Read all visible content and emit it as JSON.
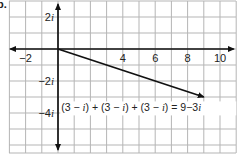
{
  "problem_label": "b.",
  "chart_data": {
    "type": "line",
    "title": "",
    "xlabel": "",
    "ylabel": "",
    "plane": "complex",
    "xlim": [
      -3,
      11
    ],
    "ylim": [
      -6.5,
      3
    ],
    "grid": true,
    "x_ticks": [
      {
        "value": -2,
        "label": "−2"
      },
      {
        "value": 4,
        "label": "4"
      },
      {
        "value": 6,
        "label": "6"
      },
      {
        "value": 8,
        "label": "8"
      },
      {
        "value": 10,
        "label": "10"
      }
    ],
    "y_ticks": [
      {
        "value": 2,
        "label": "2i"
      },
      {
        "value": -2,
        "label": "−2i"
      },
      {
        "value": -4,
        "label": "−4i"
      }
    ],
    "series": [
      {
        "name": "vector",
        "from": [
          0,
          0
        ],
        "to": [
          9,
          -3
        ],
        "arrow": true,
        "color": "#111111"
      }
    ],
    "annotations": [
      {
        "text": "(3 − i) + (3 − i) + (3 − i) = 9−3i",
        "x": 0.2,
        "y": -3.9
      }
    ]
  },
  "colors": {
    "grid": "#b5b5b5",
    "axis": "#111111",
    "vector": "#111111"
  }
}
